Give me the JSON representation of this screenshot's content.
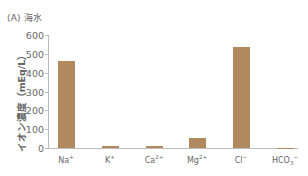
{
  "chart_data": {
    "type": "bar",
    "title": "(A) 海水",
    "xlabel": "",
    "ylabel": "イオン濃度 (mEq/L)",
    "categories": [
      "Na+",
      "K+",
      "Ca2+",
      "Mg2+",
      "Cl-",
      "HCO3-"
    ],
    "values": [
      460,
      10,
      10,
      53,
      537,
      2
    ],
    "ylim": [
      0,
      600
    ],
    "yticks": [
      0,
      100,
      200,
      300,
      400,
      500,
      600
    ],
    "grid": false,
    "legend": "none",
    "bar_color": "#b08a5e"
  },
  "labels": {
    "title": "(A) 海水",
    "ylabel": "イオン濃度（mEq/L）",
    "yticks": [
      "0",
      "100",
      "200",
      "300",
      "400",
      "500",
      "600"
    ],
    "x": [
      {
        "base": "Na",
        "sup": "+",
        "sub": ""
      },
      {
        "base": "K",
        "sup": "+",
        "sub": ""
      },
      {
        "base": "Ca",
        "sup": "2+",
        "sub": ""
      },
      {
        "base": "Mg",
        "sup": "2+",
        "sub": ""
      },
      {
        "base": "Cl",
        "sup": "−",
        "sub": ""
      },
      {
        "base": "HCO",
        "sup": "−",
        "sub": "3"
      }
    ]
  }
}
